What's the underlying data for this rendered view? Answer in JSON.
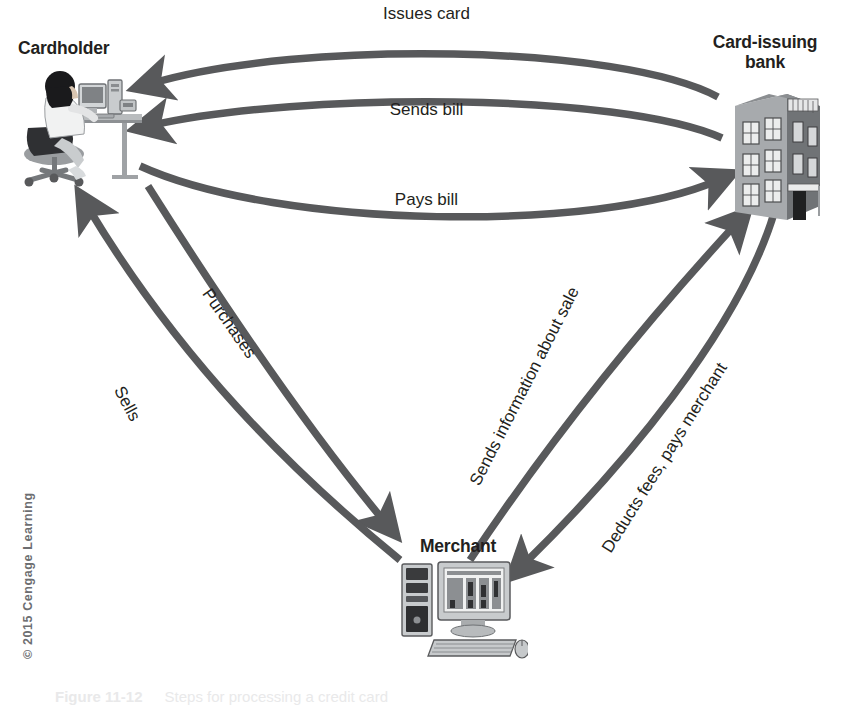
{
  "diagram": {
    "title_caption": {
      "number": "Figure 11-12",
      "text": "Steps for processing a credit card"
    },
    "copyright": "© 2015 Cengage Learning",
    "colors": {
      "arrow": "#58595b",
      "text": "#231f20",
      "copyright": "#6d6e71",
      "background": "#ffffff"
    },
    "nodes": [
      {
        "id": "cardholder",
        "label": "Cardholder",
        "icon": "person-at-computer-desk-icon"
      },
      {
        "id": "bank",
        "label": "Card-issuing\nbank",
        "icon": "bank-building-icon"
      },
      {
        "id": "merchant",
        "label": "Merchant",
        "icon": "desktop-computer-icon"
      }
    ],
    "edges": [
      {
        "id": "issues-card",
        "label": "Issues card",
        "from": "bank",
        "to": "cardholder",
        "style": "curved-horizontal"
      },
      {
        "id": "sends-bill",
        "label": "Sends bill",
        "from": "bank",
        "to": "cardholder",
        "style": "curved-horizontal"
      },
      {
        "id": "pays-bill",
        "label": "Pays bill",
        "from": "cardholder",
        "to": "bank",
        "style": "curved-horizontal"
      },
      {
        "id": "purchases",
        "label": "Purchases",
        "from": "cardholder",
        "to": "merchant",
        "style": "curved-diagonal"
      },
      {
        "id": "sells",
        "label": "Sells",
        "from": "merchant",
        "to": "cardholder",
        "style": "curved-diagonal"
      },
      {
        "id": "sends-info",
        "label": "Sends information about sale",
        "from": "merchant",
        "to": "bank",
        "style": "curved-diagonal"
      },
      {
        "id": "deducts",
        "label": "Deducts fees, pays merchant",
        "from": "bank",
        "to": "merchant",
        "style": "curved-diagonal"
      }
    ]
  }
}
